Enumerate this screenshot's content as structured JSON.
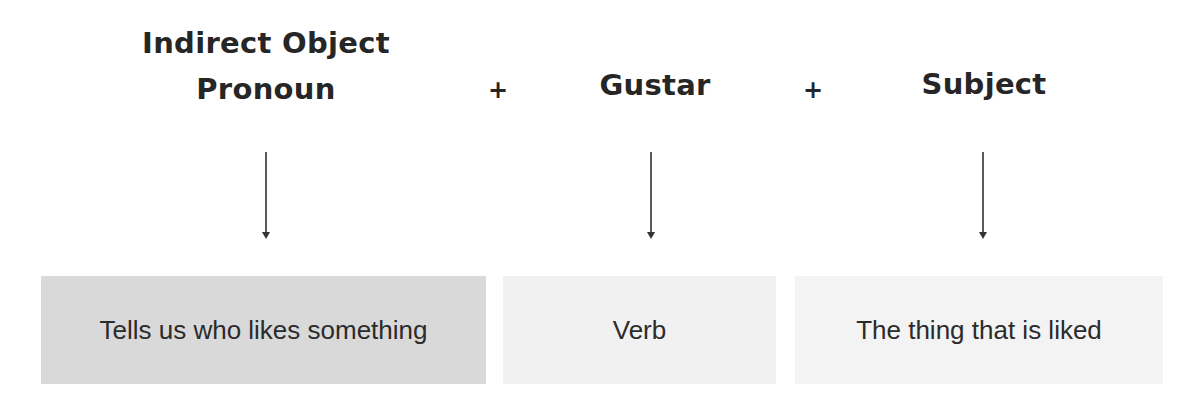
{
  "diagram": {
    "columns": [
      {
        "heading_line1": "Indirect Object",
        "heading_line2": "Pronoun",
        "description": "Tells us who likes something",
        "box_color": "#d9d9d9"
      },
      {
        "heading_line1": "Gustar",
        "description": "Verb",
        "box_color": "#f1f1f1"
      },
      {
        "heading_line1": "Subject",
        "description": "The thing that is liked",
        "box_color": "#f3f3f3"
      }
    ],
    "operators": [
      "+",
      "+"
    ],
    "arrow_color": "#333333"
  }
}
